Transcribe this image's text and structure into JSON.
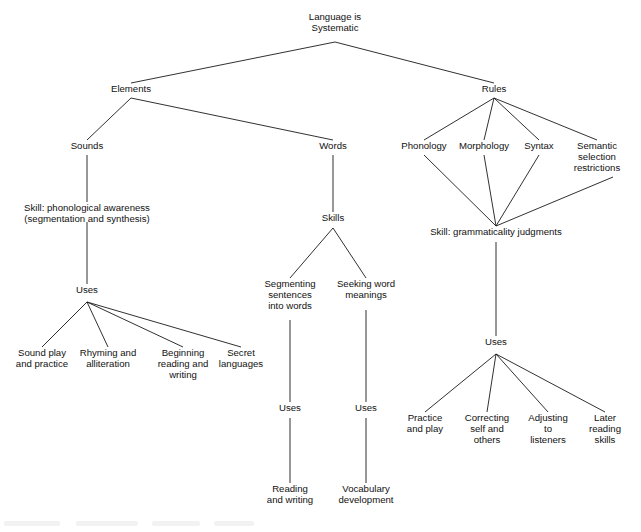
{
  "diagram": {
    "background_color": "#ffffff",
    "line_color": "#1a1a1a",
    "text_color": "#111111",
    "nodes": [
      {
        "id": "root",
        "lines": [
          "Language is",
          "Systematic"
        ],
        "x": 335,
        "y": 20
      },
      {
        "id": "elements",
        "lines": [
          "Elements"
        ],
        "x": 131,
        "y": 92
      },
      {
        "id": "rules",
        "lines": [
          "Rules"
        ],
        "x": 494,
        "y": 92
      },
      {
        "id": "sounds",
        "lines": [
          "Sounds"
        ],
        "x": 87,
        "y": 149
      },
      {
        "id": "words",
        "lines": [
          "Words"
        ],
        "x": 333,
        "y": 149
      },
      {
        "id": "phonology",
        "lines": [
          "Phonology"
        ],
        "x": 424,
        "y": 149
      },
      {
        "id": "morphology",
        "lines": [
          "Morphology"
        ],
        "x": 484,
        "y": 149
      },
      {
        "id": "syntax",
        "lines": [
          "Syntax"
        ],
        "x": 539,
        "y": 149
      },
      {
        "id": "semantic",
        "lines": [
          "Semantic",
          "selection",
          "restrictions"
        ],
        "x": 597,
        "y": 149
      },
      {
        "id": "skill-phono",
        "lines": [
          "Skill: phonological awareness",
          "(segmentation and synthesis)"
        ],
        "x": 87,
        "y": 211
      },
      {
        "id": "skill-gram",
        "lines": [
          "Skill: grammaticality judgments"
        ],
        "x": 496,
        "y": 235
      },
      {
        "id": "uses-sounds",
        "lines": [
          "Uses"
        ],
        "x": 87,
        "y": 293
      },
      {
        "id": "skills-words",
        "lines": [
          "Skills"
        ],
        "x": 333,
        "y": 221
      },
      {
        "id": "segmenting",
        "lines": [
          "Segmenting",
          "sentences",
          "into words"
        ],
        "x": 290,
        "y": 287
      },
      {
        "id": "seeking",
        "lines": [
          "Seeking word",
          "meanings"
        ],
        "x": 366,
        "y": 287
      },
      {
        "id": "uses-seg",
        "lines": [
          "Uses"
        ],
        "x": 290,
        "y": 411
      },
      {
        "id": "uses-seek",
        "lines": [
          "Uses"
        ],
        "x": 366,
        "y": 411
      },
      {
        "id": "reading-writing",
        "lines": [
          "Reading",
          "and writing"
        ],
        "x": 290,
        "y": 492
      },
      {
        "id": "vocab-dev",
        "lines": [
          "Vocabulary",
          "development"
        ],
        "x": 366,
        "y": 492
      },
      {
        "id": "sound-play",
        "lines": [
          "Sound play",
          "and practice"
        ],
        "x": 42,
        "y": 356
      },
      {
        "id": "rhyming",
        "lines": [
          "Rhyming and",
          "alliteration"
        ],
        "x": 108,
        "y": 356
      },
      {
        "id": "beginning",
        "lines": [
          "Beginning",
          "reading and",
          "writing"
        ],
        "x": 183,
        "y": 356
      },
      {
        "id": "secret",
        "lines": [
          "Secret",
          "languages"
        ],
        "x": 241,
        "y": 356
      },
      {
        "id": "uses-gram",
        "lines": [
          "Uses"
        ],
        "x": 496,
        "y": 345
      },
      {
        "id": "practice-play",
        "lines": [
          "Practice",
          "and play"
        ],
        "x": 425,
        "y": 421
      },
      {
        "id": "correcting",
        "lines": [
          "Correcting",
          "self and",
          "others"
        ],
        "x": 487,
        "y": 421
      },
      {
        "id": "adjusting",
        "lines": [
          "Adjusting",
          "to",
          "listeners"
        ],
        "x": 548,
        "y": 421
      },
      {
        "id": "later-reading",
        "lines": [
          "Later",
          "reading",
          "skills"
        ],
        "x": 605,
        "y": 421
      }
    ],
    "edges": [
      {
        "from": "root",
        "to": "elements",
        "x1": 335,
        "y1": 42,
        "x2": 131,
        "y2": 83
      },
      {
        "from": "root",
        "to": "rules",
        "x1": 335,
        "y1": 42,
        "x2": 494,
        "y2": 83
      },
      {
        "from": "elements",
        "to": "sounds",
        "x1": 131,
        "y1": 98,
        "x2": 87,
        "y2": 140
      },
      {
        "from": "elements",
        "to": "words",
        "x1": 131,
        "y1": 98,
        "x2": 333,
        "y2": 140
      },
      {
        "from": "rules",
        "to": "phonology",
        "x1": 494,
        "y1": 98,
        "x2": 424,
        "y2": 140
      },
      {
        "from": "rules",
        "to": "morphology",
        "x1": 494,
        "y1": 98,
        "x2": 484,
        "y2": 140
      },
      {
        "from": "rules",
        "to": "syntax",
        "x1": 494,
        "y1": 98,
        "x2": 539,
        "y2": 140
      },
      {
        "from": "rules",
        "to": "semantic",
        "x1": 494,
        "y1": 98,
        "x2": 597,
        "y2": 140
      },
      {
        "from": "sounds",
        "to": "skill-phono",
        "x1": 87,
        "y1": 155,
        "x2": 87,
        "y2": 202
      },
      {
        "from": "skill-phono",
        "to": "uses-sounds",
        "x1": 87,
        "y1": 222,
        "x2": 87,
        "y2": 284
      },
      {
        "from": "uses-sounds",
        "to": "sound-play",
        "x1": 87,
        "y1": 302,
        "x2": 42,
        "y2": 347
      },
      {
        "from": "uses-sounds",
        "to": "rhyming",
        "x1": 87,
        "y1": 302,
        "x2": 108,
        "y2": 347
      },
      {
        "from": "uses-sounds",
        "to": "beginning",
        "x1": 87,
        "y1": 302,
        "x2": 183,
        "y2": 347
      },
      {
        "from": "uses-sounds",
        "to": "secret",
        "x1": 87,
        "y1": 302,
        "x2": 241,
        "y2": 347
      },
      {
        "from": "words",
        "to": "skills-words",
        "x1": 333,
        "y1": 155,
        "x2": 333,
        "y2": 212
      },
      {
        "from": "skills-words",
        "to": "segmenting",
        "x1": 333,
        "y1": 228,
        "x2": 290,
        "y2": 278
      },
      {
        "from": "skills-words",
        "to": "seeking",
        "x1": 333,
        "y1": 228,
        "x2": 366,
        "y2": 278
      },
      {
        "from": "segmenting",
        "to": "uses-seg",
        "x1": 290,
        "y1": 320,
        "x2": 290,
        "y2": 402
      },
      {
        "from": "seeking",
        "to": "uses-seek",
        "x1": 366,
        "y1": 310,
        "x2": 366,
        "y2": 402
      },
      {
        "from": "uses-seg",
        "to": "reading-writing",
        "x1": 290,
        "y1": 418,
        "x2": 290,
        "y2": 483
      },
      {
        "from": "uses-seek",
        "to": "vocab-dev",
        "x1": 366,
        "y1": 418,
        "x2": 366,
        "y2": 483
      },
      {
        "from": "phonology",
        "to": "skill-gram",
        "x1": 424,
        "y1": 155,
        "x2": 496,
        "y2": 226
      },
      {
        "from": "morphology",
        "to": "skill-gram",
        "x1": 484,
        "y1": 155,
        "x2": 496,
        "y2": 226
      },
      {
        "from": "syntax",
        "to": "skill-gram",
        "x1": 539,
        "y1": 155,
        "x2": 496,
        "y2": 226
      },
      {
        "from": "semantic",
        "to": "skill-gram",
        "x1": 613,
        "y1": 177,
        "x2": 496,
        "y2": 226
      },
      {
        "from": "skill-gram",
        "to": "uses-gram",
        "x1": 496,
        "y1": 242,
        "x2": 496,
        "y2": 336
      },
      {
        "from": "uses-gram",
        "to": "practice-play",
        "x1": 496,
        "y1": 354,
        "x2": 425,
        "y2": 412
      },
      {
        "from": "uses-gram",
        "to": "correcting",
        "x1": 496,
        "y1": 354,
        "x2": 487,
        "y2": 412
      },
      {
        "from": "uses-gram",
        "to": "adjusting",
        "x1": 496,
        "y1": 354,
        "x2": 548,
        "y2": 412
      },
      {
        "from": "uses-gram",
        "to": "later-reading",
        "x1": 496,
        "y1": 354,
        "x2": 605,
        "y2": 412
      }
    ]
  }
}
